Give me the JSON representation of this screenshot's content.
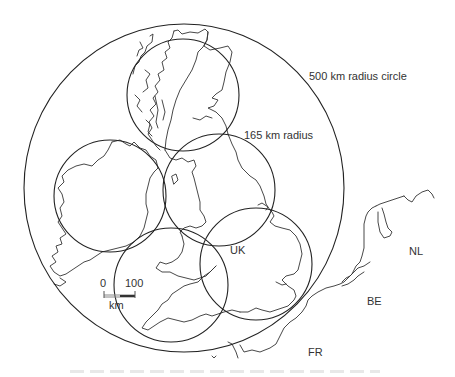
{
  "map": {
    "labels": {
      "big_circle": "500 km radius circle",
      "small_circle": "165 km radius",
      "uk": "UK",
      "nl": "NL",
      "be": "BE",
      "fr": "FR"
    },
    "scale_bar": {
      "start": "0",
      "end": "100",
      "unit": "km"
    },
    "circles": {
      "large": {
        "cx": 184,
        "cy": 188,
        "rx": 160,
        "ry": 164,
        "radius_km": 500
      },
      "small": [
        {
          "name": "scotland",
          "cx": 183,
          "cy": 95,
          "r": 56,
          "radius_km": 165
        },
        {
          "name": "ireland",
          "cx": 110,
          "cy": 196,
          "r": 56,
          "radius_km": 165
        },
        {
          "name": "northern-england",
          "cx": 219,
          "cy": 190,
          "r": 56,
          "radius_km": 165
        },
        {
          "name": "wales-southwest",
          "cx": 171,
          "cy": 285,
          "r": 57,
          "radius_km": 165
        },
        {
          "name": "southeast-england",
          "cx": 256,
          "cy": 264,
          "r": 56,
          "radius_km": 165
        }
      ]
    },
    "colors": {
      "line": "#222222",
      "coast": "#333333",
      "text": "#333333",
      "background": "#ffffff"
    }
  }
}
